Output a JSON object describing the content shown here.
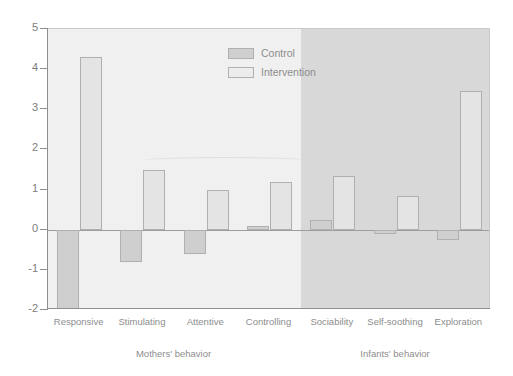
{
  "chart_data": {
    "type": "bar",
    "title": "",
    "xlabel": "",
    "ylabel": "",
    "ylim": [
      -2,
      5
    ],
    "yticks": [
      5,
      4,
      3,
      2,
      1,
      0,
      -1,
      -2
    ],
    "grid": false,
    "legend_position": "top-center",
    "categories": [
      "Responsive",
      "Stimulating",
      "Attentive",
      "Controlling",
      "Sociability",
      "Self-soothing",
      "Exploration"
    ],
    "groups": [
      {
        "label": "Mothers' behavior",
        "categories": [
          "Responsive",
          "Stimulating",
          "Attentive",
          "Controlling"
        ]
      },
      {
        "label": "Infants' behavior",
        "categories": [
          "Sociability",
          "Self-soothing",
          "Exploration"
        ]
      }
    ],
    "series": [
      {
        "name": "Control",
        "values": [
          -2.0,
          -0.8,
          -0.6,
          0.1,
          0.25,
          -0.1,
          -0.25
        ]
      },
      {
        "name": "Intervention",
        "values": [
          4.3,
          1.5,
          1.0,
          1.2,
          1.35,
          0.85,
          3.45
        ]
      }
    ]
  },
  "axis": {
    "tick_labels": [
      "5",
      "4",
      "3",
      "2",
      "1",
      "0",
      "-1",
      "-2"
    ]
  },
  "legend": {
    "items": [
      {
        "label": "Control"
      },
      {
        "label": "Intervention"
      }
    ]
  },
  "colors": {
    "control": "#cfcfcf",
    "intervention": "#e4e4e4",
    "panel_left": "#f0f0f0",
    "panel_right": "#d8d8d8",
    "axis": "#8f8f8f",
    "text": "#8d8d8d"
  }
}
